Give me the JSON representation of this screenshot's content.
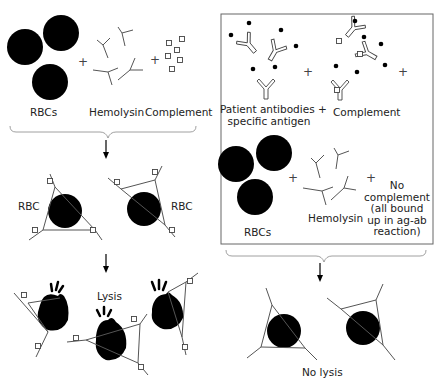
{
  "left_panel": {
    "reagents": {
      "rbcs_label": "RBCs",
      "hemolysin_label": "Hemolysin",
      "complement_label": "Complement",
      "plus": "+"
    },
    "sensitized": {
      "rbc_left_label": "RBC",
      "rbc_right_label": "RBC"
    },
    "result_label": "Lysis"
  },
  "right_panel": {
    "top": {
      "antibodies_label_line1": "Patient antibodies +",
      "antibodies_label_line2": "specific antigen",
      "complement_label": "Complement",
      "plus": "+"
    },
    "bottom": {
      "rbcs_label": "RBCs",
      "hemolysin_label": "Hemolysin",
      "no_complement_lines": [
        "No",
        "complement",
        "(all bound",
        "up in ag-ab",
        "reaction)"
      ],
      "plus": "+"
    },
    "result_label": "No lysis"
  },
  "colors": {
    "ink": "#000000",
    "line": "#555555",
    "box": "#666666"
  }
}
